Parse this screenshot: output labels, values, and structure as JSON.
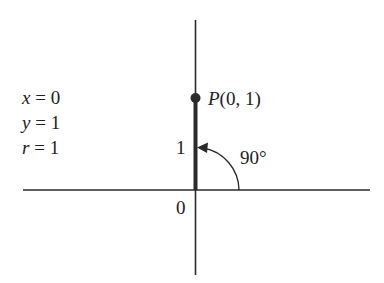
{
  "diagram": {
    "type": "unit-circle-angle",
    "equations": [
      {
        "var": "x",
        "op": " = ",
        "value": "0"
      },
      {
        "var": "y",
        "op": " = ",
        "value": "1"
      },
      {
        "var": "r",
        "op": " = ",
        "value": "1"
      }
    ],
    "point": {
      "name": "P",
      "coords": "(0, 1)"
    },
    "labels": {
      "tick_one": "1",
      "origin": "0",
      "angle": "90°"
    },
    "colors": {
      "line": "#2a2a2a",
      "background": "#ffffff"
    }
  }
}
